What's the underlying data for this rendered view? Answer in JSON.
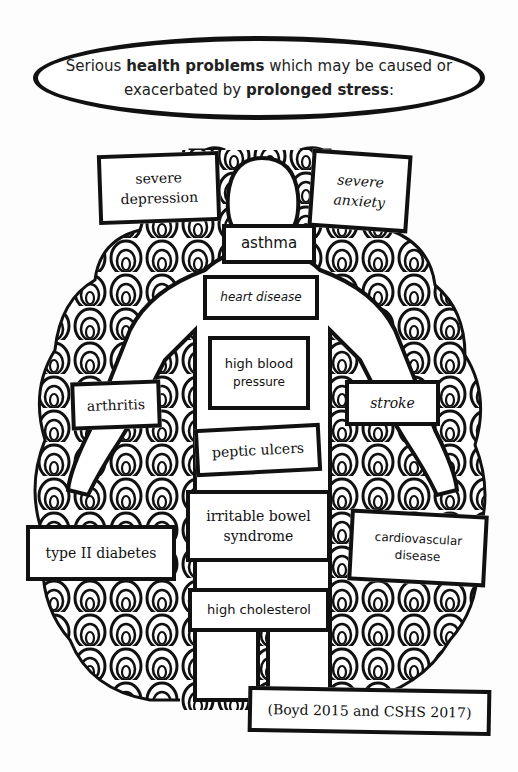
{
  "title": {
    "part1": "Serious ",
    "bold1": "health problems",
    "part2": " which may be caused or",
    "part3": "exacerbated by ",
    "bold2": "prolonged stress",
    "part4": ":"
  },
  "conditions": [
    {
      "id": "severe-depression",
      "line1": "severe",
      "line2": "depression"
    },
    {
      "id": "severe-anxiety",
      "line1": "severe",
      "line2": "anxiety"
    },
    {
      "id": "asthma",
      "line1": "asthma"
    },
    {
      "id": "heart-disease",
      "line1": "heart disease"
    },
    {
      "id": "high-blood-pressure",
      "line1": "high blood",
      "line2": "pressure"
    },
    {
      "id": "arthritis",
      "line1": "arthritis"
    },
    {
      "id": "stroke",
      "line1": "stroke"
    },
    {
      "id": "peptic-ulcers",
      "line1": "peptic ulcers"
    },
    {
      "id": "irritable-bowel-syndrome",
      "line1": "irritable bowel",
      "line2": "syndrome"
    },
    {
      "id": "type-2-diabetes",
      "line1": "type II diabetes"
    },
    {
      "id": "cardiovascular-disease",
      "line1": "cardiovascular",
      "line2": "disease"
    },
    {
      "id": "high-cholesterol",
      "line1": "high cholesterol"
    }
  ],
  "citation": "(Boyd 2015 and CSHS 2017)",
  "colors": {
    "ink": "#111111",
    "paper": "#fdfdfd"
  }
}
